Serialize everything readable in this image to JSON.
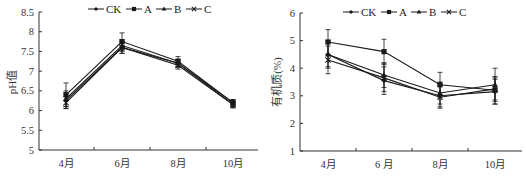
{
  "chart_data": [
    {
      "type": "line",
      "title": "",
      "xlabel": "",
      "ylabel": "pH值",
      "ylim": [
        5,
        8.5
      ],
      "yticks": [
        5,
        5.5,
        6,
        6.5,
        7,
        7.5,
        8,
        8.5
      ],
      "ytick_labels": [
        "5",
        "5.5",
        "6",
        "6.5",
        "7",
        "7.5",
        "8",
        "8.5"
      ],
      "categories": [
        "4月",
        "6月",
        "8月",
        "10月"
      ],
      "grid": false,
      "legend_position": "top",
      "error_bars": true,
      "series": [
        {
          "name": "CK",
          "marker": "diamond",
          "values": [
            6.25,
            7.6,
            7.2,
            6.15
          ],
          "errors": [
            0.2,
            0.15,
            0.1,
            0.08
          ]
        },
        {
          "name": "A",
          "marker": "square",
          "values": [
            6.4,
            7.75,
            7.25,
            6.2
          ],
          "errors": [
            0.3,
            0.22,
            0.12,
            0.08
          ]
        },
        {
          "name": "B",
          "marker": "triangle",
          "values": [
            6.3,
            7.65,
            7.2,
            6.2
          ],
          "errors": [
            0.2,
            0.15,
            0.1,
            0.08
          ]
        },
        {
          "name": "C",
          "marker": "x",
          "values": [
            6.2,
            7.6,
            7.15,
            6.15
          ],
          "errors": [
            0.15,
            0.15,
            0.1,
            0.08
          ]
        }
      ]
    },
    {
      "type": "line",
      "title": "",
      "xlabel": "",
      "ylabel": "有机质(%)",
      "ylim": [
        1,
        6
      ],
      "yticks": [
        1,
        2,
        3,
        4,
        5,
        6
      ],
      "ytick_labels": [
        "1",
        "2",
        "3",
        "4",
        "5",
        "6"
      ],
      "categories": [
        "4月",
        "6 月",
        "8月",
        "10月"
      ],
      "grid": false,
      "legend_position": "top",
      "error_bars": true,
      "series": [
        {
          "name": "CK",
          "marker": "diamond",
          "values": [
            4.5,
            3.55,
            3.0,
            3.15
          ],
          "errors": [
            0.5,
            0.5,
            0.4,
            0.45
          ]
        },
        {
          "name": "A",
          "marker": "square",
          "values": [
            4.95,
            4.6,
            3.4,
            3.2
          ],
          "errors": [
            0.45,
            0.45,
            0.45,
            0.5
          ]
        },
        {
          "name": "B",
          "marker": "triangle",
          "values": [
            4.5,
            3.75,
            3.1,
            3.4
          ],
          "errors": [
            0.45,
            0.45,
            0.4,
            0.6
          ]
        },
        {
          "name": "C",
          "marker": "x",
          "values": [
            4.3,
            3.65,
            2.95,
            3.25
          ],
          "errors": [
            0.5,
            0.5,
            0.4,
            0.4
          ]
        }
      ]
    }
  ],
  "legend": {
    "labels": [
      "CK",
      "A",
      "B",
      "C"
    ]
  },
  "colors": {
    "line": "#1a1a1a",
    "axis": "#333333",
    "background": "#ffffff"
  }
}
